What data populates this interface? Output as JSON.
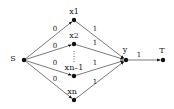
{
  "diagram": {
    "type": "flow-network",
    "colors": {
      "edge": "#444444",
      "node": "#111111",
      "text": "#222222",
      "background": "#ffffff"
    },
    "nodes": [
      {
        "id": "S",
        "label": "S",
        "x": 24,
        "y": 60,
        "label_x": 13,
        "label_y": 59
      },
      {
        "id": "x1",
        "label": "x1",
        "x": 74,
        "y": 20,
        "label_x": 74,
        "label_y": 12
      },
      {
        "id": "x2",
        "label": "x2",
        "x": 74,
        "y": 44,
        "label_x": 74,
        "label_y": 36
      },
      {
        "id": "xn-1",
        "label": "xn–1",
        "x": 74,
        "y": 76,
        "label_x": 74,
        "label_y": 68
      },
      {
        "id": "xn",
        "label": "xn",
        "x": 74,
        "y": 100,
        "label_x": 72,
        "label_y": 92
      },
      {
        "id": "y",
        "label": "y",
        "x": 126,
        "y": 60,
        "label_x": 125,
        "label_y": 50
      },
      {
        "id": "T",
        "label": "T",
        "x": 163,
        "y": 60,
        "label_x": 162,
        "label_y": 51
      }
    ],
    "edges": [
      {
        "from": "S",
        "to": "x1",
        "label": "0",
        "label_x": 55,
        "label_y": 29
      },
      {
        "from": "S",
        "to": "x2",
        "label": "0",
        "label_x": 55,
        "label_y": 46
      },
      {
        "from": "S",
        "to": "xn-1",
        "label": "0",
        "label_x": 55,
        "label_y": 63
      },
      {
        "from": "S",
        "to": "xn",
        "label": "0",
        "label_x": 55,
        "label_y": 79
      },
      {
        "from": "x1",
        "to": "y",
        "label": "1",
        "label_x": 95,
        "label_y": 29
      },
      {
        "from": "x2",
        "to": "y",
        "label": "1",
        "label_x": 95,
        "label_y": 43
      },
      {
        "from": "xn-1",
        "to": "y",
        "label": "1",
        "label_x": 95,
        "label_y": 63
      },
      {
        "from": "xn",
        "to": "y",
        "label": "1",
        "label_x": 95,
        "label_y": 82
      },
      {
        "from": "y",
        "to": "T",
        "label": "1",
        "label_x": 139,
        "label_y": 55
      }
    ],
    "ellipsis": {
      "x": 74,
      "y1": 51,
      "y2": 63
    }
  }
}
